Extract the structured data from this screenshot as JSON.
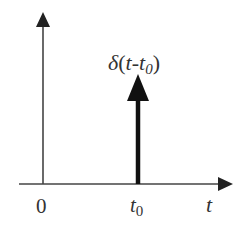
{
  "diagram": {
    "title_label": {
      "delta": "δ",
      "open": "(",
      "t": "t",
      "minus": "-",
      "t0_base": "t",
      "t0_sub": "0",
      "close": ")"
    },
    "x_axis": {
      "label": "t",
      "ticks": [
        {
          "label": "0"
        },
        {
          "base": "t",
          "sub": "0"
        }
      ]
    },
    "colors": {
      "axis": "#333333",
      "impulse": "#111111",
      "text": "#333333"
    }
  }
}
